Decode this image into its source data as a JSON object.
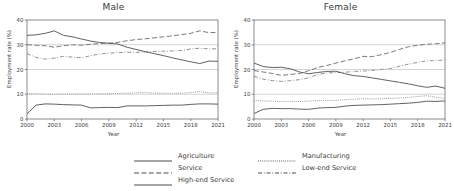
{
  "figure": {
    "xlabel": "Year",
    "ylabel": "Employment rate (%)"
  },
  "panels": [
    {
      "title": "Male"
    },
    {
      "title": "Female"
    }
  ],
  "legend": {
    "left": [
      {
        "label": "Agriculture",
        "style": "solid"
      },
      {
        "label": "Service",
        "style": "dashed"
      },
      {
        "label": "High-end Service",
        "style": "solid"
      }
    ],
    "right": [
      {
        "label": "Manufacturing",
        "style": "dotted"
      },
      {
        "label": "Low-end Service",
        "style": "dashdot"
      }
    ]
  },
  "chart_data": [
    {
      "type": "line",
      "title": "Male",
      "xlabel": "Year",
      "ylabel": "Employment rate (%)",
      "xlim": [
        2000,
        2021
      ],
      "ylim": [
        0,
        40
      ],
      "xticks": [
        2000,
        2003,
        2006,
        2009,
        2012,
        2015,
        2018,
        2021
      ],
      "yticks": [
        0,
        10,
        20,
        30,
        40
      ],
      "grid": true,
      "legend_position": "below-figure",
      "x": [
        2000,
        2001,
        2002,
        2003,
        2004,
        2005,
        2006,
        2007,
        2008,
        2009,
        2010,
        2011,
        2012,
        2013,
        2014,
        2015,
        2016,
        2017,
        2018,
        2019,
        2020,
        2021
      ],
      "series": [
        {
          "name": "Agriculture",
          "style": "solid",
          "color": "#595959",
          "values": [
            2.1,
            5.6,
            6.1,
            6.0,
            5.8,
            5.7,
            5.6,
            4.5,
            4.6,
            4.7,
            4.6,
            5.3,
            5.3,
            5.3,
            5.4,
            5.5,
            5.6,
            5.6,
            5.9,
            6.1,
            6.1,
            6.0
          ]
        },
        {
          "name": "Manufacturing",
          "style": "dotted",
          "color": "#8c8c8c",
          "values": [
            10.2,
            10.2,
            10.1,
            10.0,
            10.1,
            10.1,
            10.1,
            10.1,
            10.2,
            10.2,
            10.3,
            10.4,
            10.6,
            10.7,
            10.5,
            10.4,
            10.4,
            10.4,
            10.7,
            11.1,
            10.5,
            10.6
          ]
        },
        {
          "name": "Service",
          "style": "dashed",
          "color": "#737373",
          "values": [
            30.0,
            29.8,
            29.6,
            29.0,
            29.6,
            30.0,
            29.8,
            30.2,
            30.5,
            30.6,
            31.0,
            31.6,
            32.1,
            32.4,
            32.8,
            33.2,
            33.6,
            34.1,
            34.6,
            35.6,
            34.9,
            35.0
          ]
        },
        {
          "name": "Low-end Service",
          "style": "dashdot",
          "color": "#8c8c8c",
          "values": [
            26.4,
            24.9,
            24.2,
            24.6,
            25.3,
            25.0,
            24.7,
            25.6,
            26.3,
            26.6,
            26.8,
            27.0,
            26.9,
            27.1,
            27.3,
            27.4,
            27.5,
            27.7,
            28.3,
            28.6,
            28.3,
            28.4
          ]
        },
        {
          "name": "High-end Service",
          "style": "solid",
          "color": "#595959",
          "values": [
            33.8,
            34.0,
            34.6,
            35.6,
            33.8,
            33.2,
            32.3,
            31.5,
            30.9,
            30.6,
            30.3,
            29.0,
            28.1,
            27.2,
            26.4,
            25.6,
            24.7,
            23.9,
            23.1,
            22.4,
            23.4,
            23.3
          ]
        }
      ]
    },
    {
      "type": "line",
      "title": "Female",
      "xlabel": "Year",
      "ylabel": "Employment rate (%)",
      "xlim": [
        2000,
        2021
      ],
      "ylim": [
        0,
        40
      ],
      "xticks": [
        2000,
        2003,
        2006,
        2009,
        2012,
        2015,
        2018,
        2021
      ],
      "yticks": [
        0,
        10,
        20,
        30,
        40
      ],
      "grid": true,
      "legend_position": "below-figure",
      "x": [
        2000,
        2001,
        2002,
        2003,
        2004,
        2005,
        2006,
        2007,
        2008,
        2009,
        2010,
        2011,
        2012,
        2013,
        2014,
        2015,
        2016,
        2017,
        2018,
        2019,
        2020,
        2021
      ],
      "series": [
        {
          "name": "Agriculture",
          "style": "solid",
          "color": "#595959",
          "values": [
            2.2,
            3.9,
            4.3,
            4.2,
            4.2,
            4.0,
            3.9,
            4.4,
            4.6,
            4.7,
            5.2,
            5.5,
            5.6,
            5.7,
            5.8,
            6.0,
            6.2,
            6.4,
            6.7,
            7.2,
            7.1,
            7.3
          ]
        },
        {
          "name": "Manufacturing",
          "style": "dotted",
          "color": "#8c8c8c",
          "values": [
            7.4,
            7.3,
            7.2,
            7.1,
            7.1,
            7.1,
            7.2,
            7.4,
            7.5,
            7.5,
            7.8,
            8.0,
            8.2,
            8.1,
            8.2,
            8.3,
            8.5,
            8.7,
            9.1,
            9.4,
            8.8,
            8.3
          ]
        },
        {
          "name": "Service",
          "style": "dashed",
          "color": "#737373",
          "values": [
            19.6,
            19.0,
            18.4,
            17.6,
            18.0,
            18.4,
            19.5,
            20.8,
            21.6,
            22.6,
            23.5,
            24.3,
            25.3,
            25.2,
            26.0,
            26.9,
            28.1,
            29.2,
            29.8,
            30.2,
            30.4,
            30.8
          ]
        },
        {
          "name": "Low-end Service",
          "style": "dashdot",
          "color": "#8c8c8c",
          "values": [
            17.3,
            16.1,
            15.5,
            15.2,
            15.5,
            15.9,
            16.6,
            18.0,
            18.6,
            18.8,
            18.9,
            19.2,
            19.4,
            19.6,
            20.0,
            20.4,
            21.3,
            22.2,
            22.9,
            23.5,
            23.6,
            23.9
          ]
        },
        {
          "name": "High-end Service",
          "style": "solid",
          "color": "#595959",
          "values": [
            22.6,
            21.2,
            20.8,
            20.9,
            20.3,
            19.0,
            18.3,
            18.8,
            19.2,
            19.3,
            18.3,
            17.5,
            17.2,
            16.6,
            16.0,
            15.4,
            14.8,
            14.2,
            13.4,
            12.8,
            13.3,
            12.4
          ]
        }
      ]
    }
  ]
}
